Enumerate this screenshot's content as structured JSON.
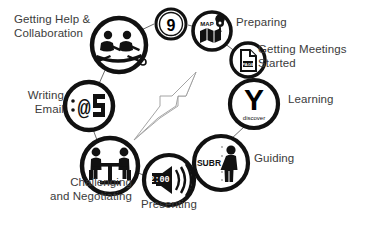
{
  "diagram": {
    "center_arrow": {
      "name": "diagonal-arrow",
      "direction": "up-right"
    },
    "step_badge": {
      "value": "9"
    },
    "colors": {
      "stroke": "#1a1a1a",
      "fill": "#000000",
      "background": "#ffffff",
      "text": "#3b3b3b",
      "connector": "#555555"
    },
    "nodes": [
      {
        "id": "getting-help",
        "label": "Getting Help &\nCollaboration",
        "icon": "rowing-team-icon",
        "icon_text": ""
      },
      {
        "id": "preparing",
        "label": "Preparing",
        "icon": "map-pin-icon",
        "icon_text": "MAP"
      },
      {
        "id": "getting-meetings-started",
        "label": "Getting Meetings\nStarted",
        "icon": "document-page-icon",
        "icon_text": "PAGE"
      },
      {
        "id": "learning",
        "label": "Learning",
        "icon": "y-discover-icon",
        "icon_text": "Y",
        "icon_subtext": "discover"
      },
      {
        "id": "guiding",
        "label": "Guiding",
        "icon": "standing-person-icon",
        "icon_text": "SUBR"
      },
      {
        "id": "presenting",
        "label": "Presenting",
        "icon": "loudspeaker-icon",
        "icon_text": "2:00"
      },
      {
        "id": "challenging-negotiating",
        "label": "Challenging\nand Negotiating",
        "icon": "two-people-at-table-icon",
        "icon_text": ""
      },
      {
        "id": "writing-email",
        "label": "Writing\nEmail",
        "icon": "at-sign-email-icon",
        "icon_text": "@"
      }
    ]
  }
}
